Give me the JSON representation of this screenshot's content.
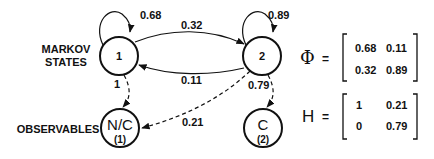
{
  "labels": {
    "markov_line1": "MARKOV",
    "markov_line2": "STATES",
    "observables": "OBSERVABLES"
  },
  "states": [
    {
      "id": "1",
      "label": "1"
    },
    {
      "id": "2",
      "label": "2"
    }
  ],
  "observables": [
    {
      "id": "1",
      "label": "N/C",
      "sub": "(1)"
    },
    {
      "id": "2",
      "label": "C",
      "sub": "(2)"
    }
  ],
  "transitions": {
    "self_1": "0.68",
    "one_to_two": "0.32",
    "two_to_one": "0.11",
    "self_2": "0.89"
  },
  "emissions": {
    "s1_to_o1": "1",
    "s2_to_o1": "0.21",
    "s2_to_o2": "0.79"
  },
  "phi_matrix": {
    "symbol": "Φ",
    "equals": "=",
    "rows": [
      [
        "0.68",
        "0.11"
      ],
      [
        "0.32",
        "0.89"
      ]
    ]
  },
  "h_matrix": {
    "symbol": "H",
    "equals": "=",
    "rows": [
      [
        "1",
        "0.21"
      ],
      [
        "0",
        "0.79"
      ]
    ]
  }
}
